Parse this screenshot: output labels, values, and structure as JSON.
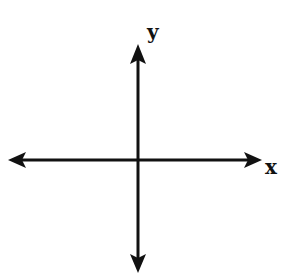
{
  "diagram": {
    "type": "cartesian-axes",
    "origin": {
      "x": 138,
      "y": 160
    },
    "x_axis": {
      "label": "x",
      "from": 8,
      "to": 262,
      "arrows": "both"
    },
    "y_axis": {
      "label": "y",
      "from": 44,
      "to": 273,
      "arrows": "both"
    },
    "stroke_color": "#111111",
    "background_color": "#ffffff"
  }
}
